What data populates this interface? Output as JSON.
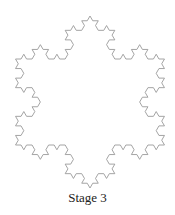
{
  "caption": "Stage 3",
  "fractal": {
    "name": "Koch snowflake",
    "stage": 3,
    "center_x": 90,
    "top_y": 16,
    "bottom_y": 188,
    "stroke_color": "#9a9a9a",
    "stroke_width": 0.9
  }
}
